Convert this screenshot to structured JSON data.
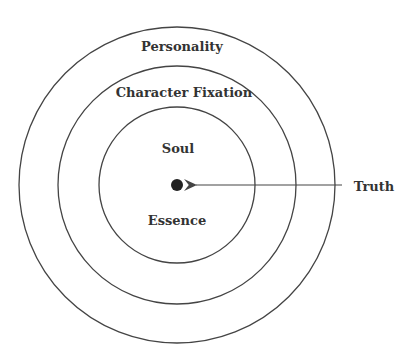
{
  "diagram": {
    "type": "concentric-circles",
    "rings": [
      {
        "label": "Personality",
        "radius": 158
      },
      {
        "label": "Character Fixation",
        "radius": 119
      },
      {
        "label": "Soul",
        "radius": 78
      }
    ],
    "inner_bottom_label": "Essence",
    "center_point": {
      "label": "Truth"
    },
    "colors": {
      "stroke": "#444444",
      "text": "#333333",
      "background": "#ffffff"
    }
  }
}
